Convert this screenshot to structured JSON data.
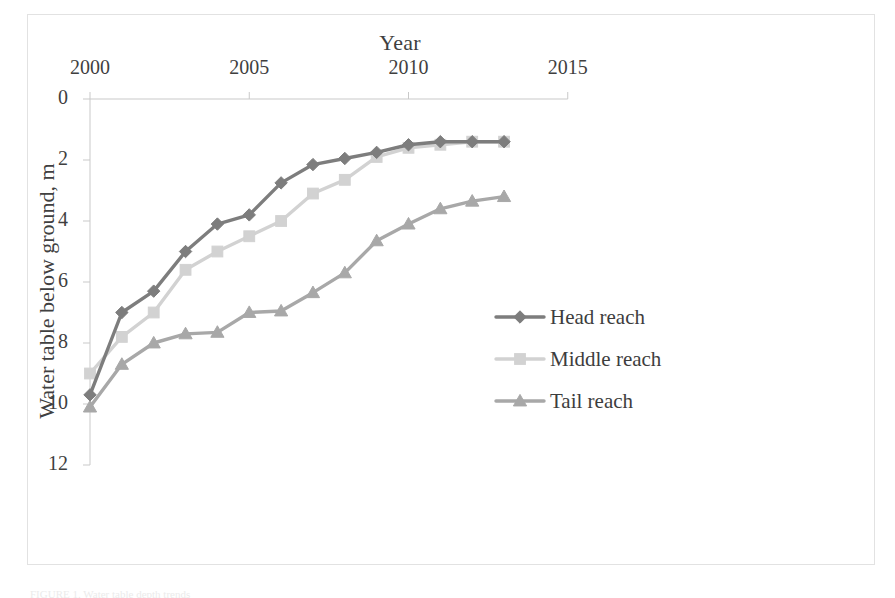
{
  "figure": {
    "caption_sliver": "FIGURE 1.  Water table depth trends"
  },
  "chart_data": {
    "type": "line",
    "title": "",
    "xlabel": "Year",
    "ylabel": "Water table below ground, m",
    "x": [
      2000,
      2001,
      2002,
      2003,
      2004,
      2005,
      2006,
      2007,
      2008,
      2009,
      2010,
      2011,
      2012,
      2013
    ],
    "xlim": [
      2000,
      2015
    ],
    "ylim": [
      0,
      12
    ],
    "y_axis_inverted": true,
    "y_axis_position": "left",
    "x_axis_position": "top",
    "x_ticks": [
      2000,
      2005,
      2010,
      2015
    ],
    "y_ticks": [
      0,
      2,
      4,
      6,
      8,
      10,
      12
    ],
    "grid": false,
    "legend_position": "center-right",
    "series": [
      {
        "name": "Head reach",
        "color": "#7d7d7d",
        "marker": "diamond",
        "values": [
          9.7,
          7.0,
          6.3,
          5.0,
          4.1,
          3.8,
          2.75,
          2.15,
          1.95,
          1.75,
          1.5,
          1.4,
          1.4,
          1.4
        ]
      },
      {
        "name": "Middle reach",
        "color": "#d2d2d2",
        "marker": "square",
        "values": [
          9.0,
          7.8,
          7.0,
          5.6,
          5.0,
          4.5,
          4.0,
          3.1,
          2.65,
          1.9,
          1.6,
          1.5,
          1.4,
          1.4
        ]
      },
      {
        "name": "Tail reach",
        "color": "#a8a8a8",
        "marker": "triangle",
        "values": [
          10.1,
          8.7,
          8.0,
          7.7,
          7.65,
          7.0,
          6.95,
          6.35,
          5.7,
          4.65,
          4.1,
          3.6,
          3.35,
          3.2
        ]
      }
    ]
  }
}
